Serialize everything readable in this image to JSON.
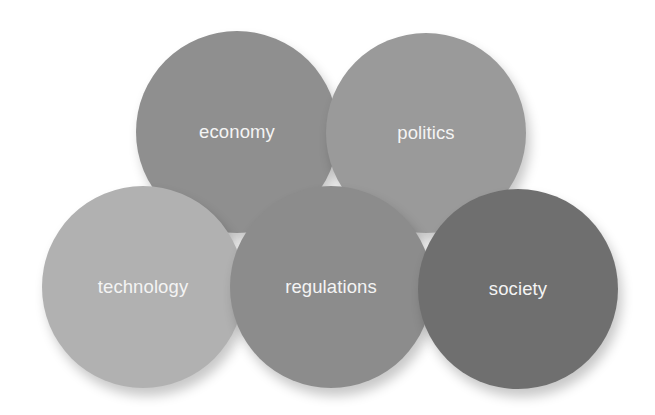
{
  "diagram": {
    "type": "overlapping-circles",
    "background": "#ffffff",
    "circles": [
      {
        "id": "economy",
        "label": "economy",
        "color": "#8f8f8f",
        "cx": 237,
        "cy": 132,
        "r": 101,
        "z": 1
      },
      {
        "id": "politics",
        "label": "politics",
        "color": "#9a9a9a",
        "cx": 426,
        "cy": 133,
        "r": 100,
        "z": 2
      },
      {
        "id": "technology",
        "label": "technology",
        "color": "#b1b1b1",
        "cx": 143,
        "cy": 287,
        "r": 101,
        "z": 3
      },
      {
        "id": "regulations",
        "label": "regulations",
        "color": "#8c8c8c",
        "cx": 331,
        "cy": 287,
        "r": 101,
        "z": 4
      },
      {
        "id": "society",
        "label": "society",
        "color": "#6f6f6f",
        "cx": 518,
        "cy": 289,
        "r": 100,
        "z": 5
      }
    ]
  }
}
